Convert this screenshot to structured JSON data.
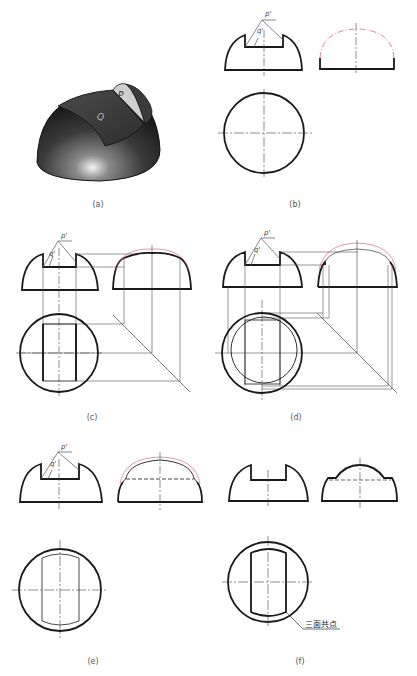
{
  "figure": {
    "panels": [
      {
        "id": "a",
        "label": "(a)",
        "type": "3d-view",
        "faces": {
          "p": "P",
          "q": "Q"
        }
      },
      {
        "id": "b",
        "label": "(b)",
        "type": "three-view",
        "annotations": {
          "p": "p'",
          "q": "q'"
        }
      },
      {
        "id": "c",
        "label": "(c)",
        "type": "three-view",
        "annotations": {
          "p": "p'",
          "q": "q'"
        }
      },
      {
        "id": "d",
        "label": "(d)",
        "type": "three-view",
        "annotations": {
          "p": "p'",
          "q": "q'"
        }
      },
      {
        "id": "e",
        "label": "(e)",
        "type": "three-view",
        "annotations": {
          "p": "p'",
          "q": "q'"
        }
      },
      {
        "id": "f",
        "label": "(f)",
        "type": "three-view",
        "note": "三面共点"
      }
    ],
    "colors": {
      "outline": "#1a1a1a",
      "thin_line": "#555555",
      "construction_red": "#d0506a",
      "dome_dark": "#2c2c2c",
      "face_p": "#cfcfcf",
      "face_q": "#3a3a3a"
    }
  }
}
